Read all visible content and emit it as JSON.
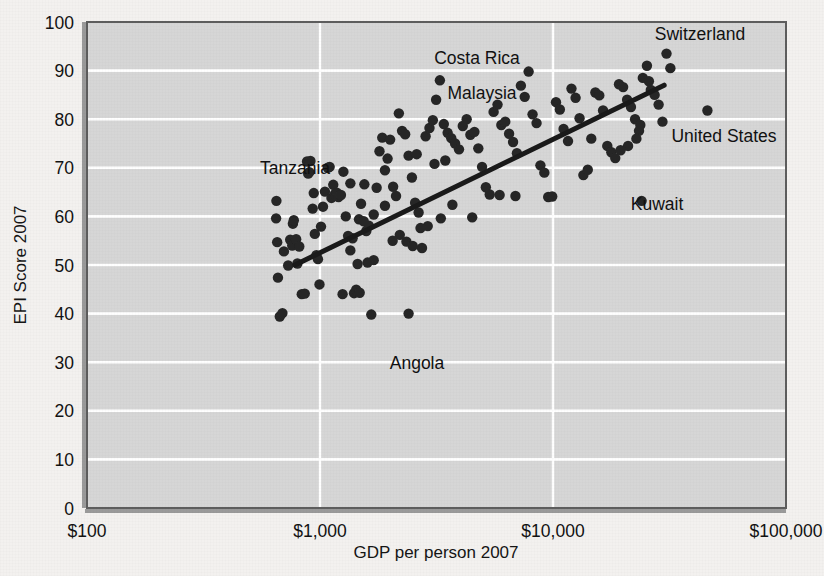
{
  "chart_data": {
    "type": "scatter",
    "title": "",
    "xlabel": "GDP per person 2007",
    "ylabel": "EPI Score 2007",
    "xscale": "log",
    "xlim": [
      100,
      100000
    ],
    "ylim": [
      0,
      100
    ],
    "xticks": [
      100,
      1000,
      10000,
      100000
    ],
    "xticklabels": [
      "$100",
      "$1,000",
      "$10,000",
      "$100,000"
    ],
    "yticks": [
      0,
      10,
      20,
      30,
      40,
      50,
      60,
      70,
      80,
      90,
      100
    ],
    "yticklabels": [
      "0",
      "10",
      "20",
      "30",
      "40",
      "50",
      "60",
      "70",
      "80",
      "90",
      "100"
    ],
    "grid": "horizontal-and-vertical",
    "legend": "none",
    "plot_background": "#d6d6d6",
    "gridline_color": "#ffffff",
    "marker_color": "#262626",
    "trendline_color": "#1a1a1a",
    "trendline": {
      "label": "linear fit on log(GDP)",
      "x_start": 780,
      "y_start": 50.0,
      "x_end": 30000,
      "y_end": 87.0
    },
    "annotations": [
      {
        "label": "Tanzania",
        "text_x": 295,
        "text_y": 174,
        "anchor": "middle"
      },
      {
        "label": "Malaysia",
        "text_x": 482,
        "text_y": 99,
        "anchor": "middle"
      },
      {
        "label": "Costa Rica",
        "text_x": 477,
        "text_y": 64,
        "anchor": "middle"
      },
      {
        "label": "Switzerland",
        "text_x": 700,
        "text_y": 40,
        "anchor": "middle"
      },
      {
        "label": "United States",
        "text_x": 724,
        "text_y": 142,
        "anchor": "middle"
      },
      {
        "label": "Kuwait",
        "text_x": 657,
        "text_y": 210,
        "anchor": "middle"
      },
      {
        "label": "Angola",
        "text_x": 417,
        "text_y": 369,
        "anchor": "middle"
      }
    ],
    "points": [
      [
        650,
        63.2
      ],
      [
        648,
        59.6
      ],
      [
        655,
        54.7
      ],
      [
        660,
        47.4
      ],
      [
        672,
        39.4
      ],
      [
        690,
        40.1
      ],
      [
        700,
        52.8
      ],
      [
        730,
        49.9
      ],
      [
        745,
        55.2
      ],
      [
        760,
        54.0
      ],
      [
        765,
        58.5
      ],
      [
        772,
        59.2
      ],
      [
        790,
        55.3
      ],
      [
        800,
        50.3
      ],
      [
        815,
        53.8
      ],
      [
        835,
        44.0
      ],
      [
        860,
        44.1
      ],
      [
        880,
        71.3
      ],
      [
        890,
        68.8
      ],
      [
        900,
        69.1
      ],
      [
        910,
        71.4
      ],
      [
        930,
        61.6
      ],
      [
        940,
        64.8
      ],
      [
        950,
        56.4
      ],
      [
        965,
        52.0
      ],
      [
        980,
        51.2
      ],
      [
        995,
        46.0
      ],
      [
        1010,
        57.9
      ],
      [
        1030,
        62.0
      ],
      [
        1050,
        65.1
      ],
      [
        1080,
        70.0
      ],
      [
        1100,
        70.2
      ],
      [
        1120,
        63.8
      ],
      [
        1140,
        66.5
      ],
      [
        1160,
        64.6
      ],
      [
        1180,
        64.9
      ],
      [
        1200,
        64.0
      ],
      [
        1230,
        64.4
      ],
      [
        1260,
        69.2
      ],
      [
        1290,
        60.0
      ],
      [
        1320,
        56.0
      ],
      [
        1350,
        53.0
      ],
      [
        1380,
        55.5
      ],
      [
        1400,
        44.2
      ],
      [
        1430,
        44.9
      ],
      [
        1470,
        59.4
      ],
      [
        1500,
        62.6
      ],
      [
        1540,
        59.0
      ],
      [
        1580,
        57.0
      ],
      [
        1620,
        58.1
      ],
      [
        1660,
        39.8
      ],
      [
        1700,
        60.4
      ],
      [
        1750,
        65.9
      ],
      [
        1800,
        73.4
      ],
      [
        1850,
        76.2
      ],
      [
        1900,
        69.5
      ],
      [
        1950,
        71.9
      ],
      [
        2000,
        75.8
      ],
      [
        2060,
        66.1
      ],
      [
        2120,
        64.2
      ],
      [
        2180,
        81.2
      ],
      [
        2250,
        77.6
      ],
      [
        2320,
        76.9
      ],
      [
        2400,
        72.5
      ],
      [
        2480,
        68.0
      ],
      [
        2560,
        62.8
      ],
      [
        2650,
        60.8
      ],
      [
        2740,
        53.5
      ],
      [
        2840,
        76.5
      ],
      [
        2950,
        78.2
      ],
      [
        3050,
        79.8
      ],
      [
        3150,
        84.0
      ],
      [
        3270,
        88.0
      ],
      [
        3400,
        79.0
      ],
      [
        3530,
        77.2
      ],
      [
        3660,
        76.1
      ],
      [
        3800,
        75.0
      ],
      [
        3950,
        73.8
      ],
      [
        4100,
        78.6
      ],
      [
        4260,
        80.0
      ],
      [
        4420,
        76.8
      ],
      [
        4600,
        77.4
      ],
      [
        4780,
        74.0
      ],
      [
        4960,
        70.2
      ],
      [
        5150,
        66.0
      ],
      [
        5350,
        64.5
      ],
      [
        5560,
        81.5
      ],
      [
        5780,
        83.0
      ],
      [
        6000,
        78.8
      ],
      [
        6240,
        79.5
      ],
      [
        6480,
        77.0
      ],
      [
        6740,
        75.3
      ],
      [
        7000,
        73.0
      ],
      [
        7280,
        86.9
      ],
      [
        7560,
        84.6
      ],
      [
        7860,
        89.8
      ],
      [
        8170,
        81.0
      ],
      [
        8500,
        79.2
      ],
      [
        8830,
        70.5
      ],
      [
        9180,
        69.0
      ],
      [
        9540,
        64.0
      ],
      [
        9920,
        64.1
      ],
      [
        10300,
        83.5
      ],
      [
        10700,
        82.0
      ],
      [
        11100,
        78.0
      ],
      [
        11600,
        75.5
      ],
      [
        12000,
        86.3
      ],
      [
        12500,
        84.4
      ],
      [
        13000,
        80.2
      ],
      [
        13500,
        68.5
      ],
      [
        14100,
        69.6
      ],
      [
        14600,
        76.0
      ],
      [
        15200,
        85.5
      ],
      [
        15800,
        84.9
      ],
      [
        16400,
        81.8
      ],
      [
        17100,
        74.5
      ],
      [
        17800,
        73.2
      ],
      [
        18500,
        72.0
      ],
      [
        19200,
        87.2
      ],
      [
        20000,
        86.6
      ],
      [
        20800,
        84.0
      ],
      [
        21600,
        82.5
      ],
      [
        22500,
        80.0
      ],
      [
        23400,
        77.6
      ],
      [
        24300,
        88.5
      ],
      [
        25300,
        91.0
      ],
      [
        26300,
        86.0
      ],
      [
        27300,
        85.0
      ],
      [
        28400,
        83.0
      ],
      [
        29500,
        79.5
      ],
      [
        30700,
        93.5
      ],
      [
        31900,
        90.5
      ],
      [
        24000,
        63.2
      ],
      [
        46000,
        81.8
      ],
      [
        2400,
        40.0
      ],
      [
        1250,
        44.0
      ],
      [
        1480,
        44.3
      ],
      [
        22800,
        76.0
      ],
      [
        23700,
        78.8
      ],
      [
        21000,
        74.5
      ],
      [
        19500,
        73.6
      ],
      [
        25800,
        87.8
      ],
      [
        5900,
        64.4
      ],
      [
        6900,
        64.2
      ],
      [
        4500,
        59.8
      ],
      [
        3300,
        59.6
      ],
      [
        3700,
        62.4
      ],
      [
        2900,
        58.0
      ],
      [
        2700,
        57.6
      ],
      [
        3100,
        70.8
      ],
      [
        3450,
        71.5
      ],
      [
        2600,
        72.8
      ],
      [
        1350,
        66.8
      ],
      [
        1550,
        66.6
      ],
      [
        1900,
        62.2
      ],
      [
        2200,
        56.2
      ],
      [
        2050,
        55.0
      ],
      [
        2350,
        54.8
      ],
      [
        2500,
        53.9
      ],
      [
        1700,
        51.0
      ],
      [
        1600,
        50.5
      ],
      [
        1450,
        50.2
      ]
    ]
  },
  "figure": {
    "plot_left_px": 87,
    "plot_top_px": 22,
    "plot_right_px": 786,
    "plot_bottom_px": 508
  }
}
